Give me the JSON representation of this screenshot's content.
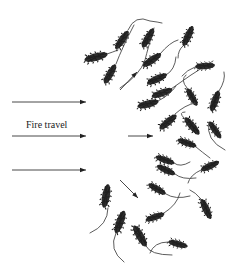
{
  "diagram": {
    "colors": {
      "background": "#ffffff",
      "seed": "#2e2e2e",
      "awn": "#4a4a4a",
      "arrow": "#222222",
      "text": "#222222"
    },
    "label": {
      "text": "Fire travel",
      "x": 26,
      "y": 120
    },
    "fire_arrows": [
      {
        "x1": 12,
        "y1": 102,
        "x2": 86,
        "y2": 102
      },
      {
        "x1": 12,
        "y1": 136,
        "x2": 86,
        "y2": 136
      },
      {
        "x1": 12,
        "y1": 170,
        "x2": 86,
        "y2": 170
      }
    ],
    "motion_arrows": [
      {
        "x1": 120,
        "y1": 90,
        "x2": 137,
        "y2": 72,
        "direction": "up-right"
      },
      {
        "x1": 128,
        "y1": 136,
        "x2": 153,
        "y2": 136,
        "direction": "right"
      },
      {
        "x1": 120,
        "y1": 180,
        "x2": 138,
        "y2": 198,
        "direction": "down-right"
      }
    ],
    "seeds": [
      {
        "cx": 96,
        "cy": 57,
        "len": 24,
        "angle": -15,
        "awn": "M107,54 Q113,52 118,50"
      },
      {
        "cx": 122,
        "cy": 40,
        "len": 22,
        "angle": -55,
        "awn": "M128,30 Q135,14 150,21 Q158,22 162,23"
      },
      {
        "cx": 110,
        "cy": 74,
        "len": 22,
        "angle": -60,
        "awn": "M116,64 Q122,48 134,25"
      },
      {
        "cx": 148,
        "cy": 38,
        "len": 22,
        "angle": -60,
        "awn": "M154,28 Q148,48 145,60 Q140,75 120,88"
      },
      {
        "cx": 188,
        "cy": 36,
        "len": 22,
        "angle": -65,
        "awn": "M183,46 Q178,50 178,58"
      },
      {
        "cx": 152,
        "cy": 60,
        "len": 22,
        "angle": -35,
        "awn": "M160,54 Q170,42 178,40"
      },
      {
        "cx": 157,
        "cy": 79,
        "len": 22,
        "angle": -25,
        "awn": "M166,75 Q175,70 176,57"
      },
      {
        "cx": 162,
        "cy": 93,
        "len": 22,
        "angle": -20,
        "awn": "M171,89 Q190,75 213,61"
      },
      {
        "cx": 205,
        "cy": 66,
        "len": 20,
        "angle": -5,
        "awn": "M195,67 Q187,70 182,76"
      },
      {
        "cx": 148,
        "cy": 104,
        "len": 22,
        "angle": -15,
        "awn": "M158,101 Q170,95 176,86"
      },
      {
        "cx": 192,
        "cy": 97,
        "len": 20,
        "angle": 60,
        "awn": "M187,88 Q180,80 186,75"
      },
      {
        "cx": 215,
        "cy": 101,
        "len": 22,
        "angle": -70,
        "awn": "M219,91 Q226,80 224,72"
      },
      {
        "cx": 168,
        "cy": 122,
        "len": 22,
        "angle": -40,
        "awn": "M175,114 Q185,105 195,103"
      },
      {
        "cx": 192,
        "cy": 126,
        "len": 22,
        "angle": 50,
        "awn": "M184,118 Q178,112 185,112"
      },
      {
        "cx": 215,
        "cy": 130,
        "len": 20,
        "angle": 55,
        "awn": "M209,122 Q205,140 225,150"
      },
      {
        "cx": 165,
        "cy": 160,
        "len": 20,
        "angle": 20,
        "awn": "M174,163 Q180,168 190,162"
      },
      {
        "cx": 166,
        "cy": 170,
        "len": 20,
        "angle": 25,
        "awn": "M175,174 Q182,180 196,178"
      },
      {
        "cx": 210,
        "cy": 166,
        "len": 20,
        "angle": -25,
        "awn": "M201,170 Q190,175 188,183"
      },
      {
        "cx": 157,
        "cy": 189,
        "len": 20,
        "angle": 30,
        "awn": "M166,194 Q175,200 190,196"
      },
      {
        "cx": 206,
        "cy": 209,
        "len": 22,
        "angle": 65,
        "awn": "M201,199 Q195,192 190,190"
      },
      {
        "cx": 187,
        "cy": 143,
        "len": 20,
        "angle": 20,
        "awn": "M196,147 Q202,152 210,158"
      },
      {
        "cx": 155,
        "cy": 217,
        "len": 20,
        "angle": -20,
        "awn": "M164,213 Q177,205 180,193"
      },
      {
        "cx": 106,
        "cy": 196,
        "len": 24,
        "angle": -80,
        "awn": "M108,208 Q108,225 90,233"
      },
      {
        "cx": 120,
        "cy": 222,
        "len": 24,
        "angle": -70,
        "awn": "M116,233 Q108,250 124,262"
      },
      {
        "cx": 140,
        "cy": 236,
        "len": 24,
        "angle": 60,
        "awn": "M146,246 Q150,255 172,255"
      },
      {
        "cx": 178,
        "cy": 244,
        "len": 20,
        "angle": 15,
        "awn": "M168,242 Q154,242 150,253"
      }
    ]
  }
}
